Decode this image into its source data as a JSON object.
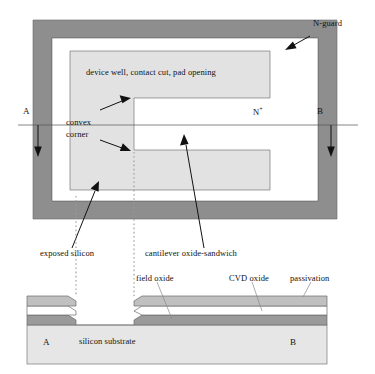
{
  "figure": {
    "type": "semiconductor-process-diagram"
  },
  "colors": {
    "n_guard_band": "#8e8e8e",
    "device_well": "#e2e2e2",
    "passivation_layer": "#c0c0c0",
    "cvd_oxide_layer": "#ffffff",
    "field_oxide_layer": "#9a9a9a",
    "silicon_substrate": "#e6e6e6",
    "outline": "#555555",
    "guide_dotted": "#9a9a9a",
    "background": "#ffffff"
  },
  "plan_view": {
    "labels": {
      "n_guard": "N-guard",
      "device_well": "device well, contact cut, pad opening",
      "convex_corner_line1": "convex",
      "convex_corner_line2": "corner",
      "n_plus_base": "N",
      "n_plus_sup": "+",
      "section_left": "A",
      "section_right": "B"
    }
  },
  "callouts": {
    "exposed_silicon": "exposed silicon",
    "cantilever_oxide_sandwich": "cantilever oxide-sandwich"
  },
  "cross_section": {
    "labels": {
      "field_oxide": "field oxide",
      "cvd_oxide": "CVD oxide",
      "passivation": "passivation",
      "silicon_substrate": "silicon substrate",
      "section_left": "A",
      "section_right": "B"
    }
  }
}
